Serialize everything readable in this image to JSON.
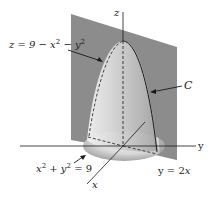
{
  "diagram": {
    "type": "3d-surface-intersection",
    "surfaces": [
      {
        "name": "paraboloid",
        "equation_label": "z = 9 − x² − y²"
      },
      {
        "name": "vertical-plane",
        "equation_label": "y = 2x"
      },
      {
        "name": "cylinder-base",
        "equation_label": "x² + y² = 9"
      }
    ],
    "curve_label": "C",
    "axes": {
      "x": "x",
      "y": "y",
      "z": "z"
    },
    "colors": {
      "plane": "#8c8c8c",
      "paraboloid_light": "#e8e8e8",
      "paraboloid_dark": "#a9a9a9",
      "lines": "#1a1a1a",
      "background": "#ffffff"
    }
  },
  "labels": {
    "z_axis": "z",
    "y_axis": "y",
    "x_axis": "x",
    "curve": "C",
    "paraboloid_eq": {
      "lhs": "z = 9 − x",
      "exp1": "2",
      "mid": " − y",
      "exp2": "2"
    },
    "circle_eq": {
      "a": "x",
      "exp1": "2",
      "mid": " + y",
      "exp2": "2",
      "rhs": " = 9"
    },
    "plane_eq": {
      "lhs": "y = 2",
      "var": "x"
    }
  }
}
